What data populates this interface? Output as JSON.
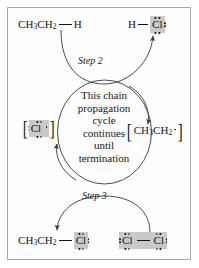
{
  "figure": {
    "border_color": "#a9a9a9",
    "highlight_color": "#c9c9c9",
    "ink_color": "#141414"
  },
  "steps": {
    "step2_label": "Step 2",
    "step3_label": "Step 3"
  },
  "cycle_text": {
    "lines": [
      "This chain",
      "propagation",
      "cycle",
      "continues",
      "until",
      "termination"
    ],
    "line1": "This chain",
    "line2": "propagation",
    "line3": "cycle",
    "line4": "continues",
    "line5": "until",
    "line6": "termination"
  },
  "species": {
    "ethane": {
      "name": "ethane",
      "c1": "CH",
      "sub1": "3",
      "c2": "CH",
      "sub2": "2",
      "h": "H",
      "highlight": false
    },
    "hydrogen_chloride": {
      "name": "hydrogen chloride",
      "h": "H",
      "cl": "Cl",
      "highlight": true,
      "lone_pairs": [
        "top",
        "bottom",
        "right"
      ]
    },
    "chlorine_radical": {
      "name": "chlorine radical",
      "bracket_open": "[",
      "bracket_close": "]",
      "cl": "Cl",
      "highlight": true,
      "lone_pairs": [
        "top",
        "bottom",
        "left"
      ],
      "radical": true
    },
    "ethyl_radical": {
      "name": "ethyl radical",
      "bracket_open": "[",
      "bracket_close": "]",
      "c1": "CH",
      "sub1": "3",
      "c2": "CH",
      "sub2": "2",
      "highlight": false,
      "radical": true
    },
    "chloroethane": {
      "name": "chloroethane",
      "c1": "CH",
      "sub1": "3",
      "c2": "CH",
      "sub2": "2",
      "cl": "Cl",
      "highlight": true,
      "lone_pairs": [
        "top",
        "bottom",
        "right"
      ]
    },
    "chlorine_molecule": {
      "name": "chlorine molecule",
      "cl_left": "Cl",
      "cl_right": "Cl",
      "highlight": true,
      "lone_pairs_left": [
        "top",
        "bottom",
        "left"
      ],
      "lone_pairs_right": [
        "top",
        "bottom",
        "right"
      ]
    }
  }
}
